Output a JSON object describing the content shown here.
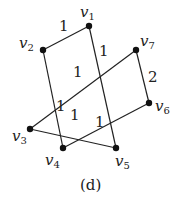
{
  "caption": "(d)",
  "nodes": [
    {
      "id": "v1",
      "base": "v",
      "sub": "1",
      "x": 89,
      "y": 26
    },
    {
      "id": "v2",
      "base": "v",
      "sub": "2",
      "x": 43,
      "y": 50
    },
    {
      "id": "v3",
      "base": "v",
      "sub": "3",
      "x": 30,
      "y": 129
    },
    {
      "id": "v4",
      "base": "v",
      "sub": "4",
      "x": 63,
      "y": 148
    },
    {
      "id": "v5",
      "base": "v",
      "sub": "5",
      "x": 116,
      "y": 148
    },
    {
      "id": "v6",
      "base": "v",
      "sub": "6",
      "x": 149,
      "y": 103
    },
    {
      "id": "v7",
      "base": "v",
      "sub": "7",
      "x": 136,
      "y": 50
    }
  ],
  "edges": [
    {
      "from": "v1",
      "to": "v2",
      "weight": "1"
    },
    {
      "from": "v1",
      "to": "v5",
      "weight": "1"
    },
    {
      "from": "v2",
      "to": "v4",
      "weight": "1"
    },
    {
      "from": "v7",
      "to": "v3",
      "weight": "1"
    },
    {
      "from": "v7",
      "to": "v6",
      "weight": "2"
    },
    {
      "from": "v3",
      "to": "v5",
      "weight": "1"
    },
    {
      "from": "v4",
      "to": "v6",
      "weight": "1"
    }
  ]
}
